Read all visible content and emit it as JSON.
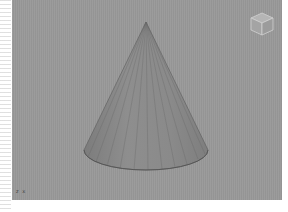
{
  "viewport": {
    "background": "#999999",
    "object": {
      "type": "cone",
      "fill": "#8a8a8a",
      "edge_color": "#555555",
      "segments": 16
    },
    "viewcube": {
      "icon": "viewcube-icon"
    },
    "axis_indicator": {
      "label": "z  x"
    }
  }
}
